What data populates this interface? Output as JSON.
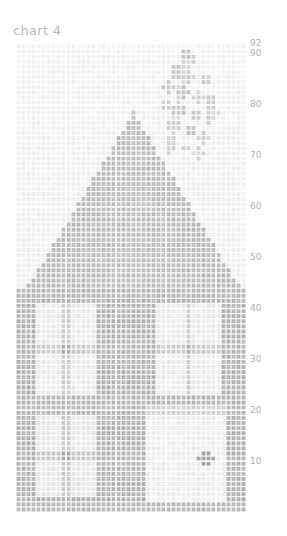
{
  "chart": {
    "title": "chart 4",
    "colors": {
      "background": "#ffffff",
      "title_text": "#b9b9b9",
      "tick_text": "#b0b0b0",
      "grid_line": "#ffffff",
      "cell_light": "#f2f2f2",
      "cell_mid": "#c9c9c9",
      "cell_dark": "#8f8f8f"
    }
  },
  "chart_data": {
    "type": "heatmap",
    "title": "chart 4",
    "subtitle": "",
    "xlabel": "",
    "ylabel": "",
    "grid": true,
    "legend": "none",
    "cols": 46,
    "rows": 92,
    "xlim": [
      0,
      46
    ],
    "ylim": [
      0,
      92
    ],
    "x_tick_labels": [],
    "y_tick_labels": [
      "92",
      "90",
      "80",
      "70",
      "60",
      "50",
      "40",
      "30",
      "20",
      "10"
    ],
    "y_tick_values": [
      92,
      90,
      80,
      70,
      60,
      50,
      40,
      30,
      20,
      10
    ],
    "value_range": [
      0,
      100
    ],
    "colormap": "grayscale_light_to_dark",
    "regions": [
      {
        "name": "sky-background",
        "x": [
          0,
          46
        ],
        "y": [
          52,
          92
        ],
        "value": 8
      },
      {
        "name": "flower-plant",
        "x": [
          28,
          41
        ],
        "y": [
          70,
          91
        ],
        "value": 45
      },
      {
        "name": "roof-triangle-apex",
        "x": [
          21,
          28
        ],
        "y": [
          72,
          79
        ],
        "value": 52
      },
      {
        "name": "roof-triangle-body",
        "x": [
          4,
          44
        ],
        "y": [
          44,
          78
        ],
        "value": 55
      },
      {
        "name": "wall-left",
        "x": [
          0,
          46
        ],
        "y": [
          0,
          44
        ],
        "value": 58
      },
      {
        "name": "window-upper-left",
        "x": [
          4,
          16
        ],
        "y": [
          22,
          40
        ],
        "value": 14
      },
      {
        "name": "window-upper-right",
        "x": [
          28,
          41
        ],
        "y": [
          22,
          40
        ],
        "value": 14
      },
      {
        "name": "window-lower-left",
        "x": [
          4,
          16
        ],
        "y": [
          2,
          18
        ],
        "value": 16
      },
      {
        "name": "door",
        "x": [
          26,
          42
        ],
        "y": [
          1,
          19
        ],
        "value": 12
      },
      {
        "name": "doorknob",
        "x": [
          37,
          39
        ],
        "y": [
          9,
          11
        ],
        "value": 72
      }
    ]
  }
}
